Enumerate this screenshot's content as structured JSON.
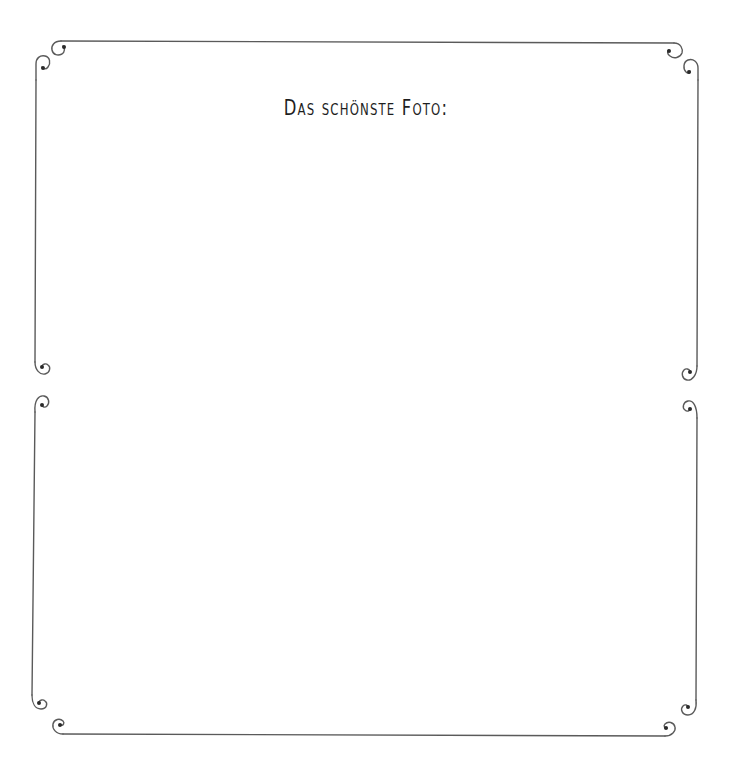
{
  "page": {
    "title": "Das schönste Foto:",
    "background_color": "#ffffff",
    "frame_color": "#5a5a5a"
  },
  "frames": [
    {
      "name": "top-photo-frame",
      "label": "photo area"
    },
    {
      "name": "bottom-photo-frame",
      "label": "photo area"
    }
  ],
  "icons": {
    "corner": "scroll-curl-ornament"
  }
}
